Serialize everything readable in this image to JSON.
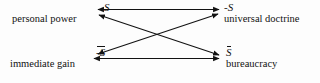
{
  "diagram": {
    "type": "semiotic-square",
    "title": "",
    "background_color": "#fdfdfd",
    "stroke_color": "#121212",
    "nodes": [
      {
        "id": "s",
        "position": "top-left",
        "symbol": "S",
        "symbol_overbar": false,
        "symbol_negated": false,
        "label": "personal power"
      },
      {
        "id": "not-s",
        "position": "top-right",
        "symbol": "-S",
        "symbol_overbar": false,
        "symbol_negated": true,
        "label": "universal doctrine"
      },
      {
        "id": "not-s-bar",
        "position": "bottom-left",
        "symbol": "-S",
        "symbol_overbar": true,
        "symbol_negated": true,
        "label": "immediate gain"
      },
      {
        "id": "s-bar",
        "position": "bottom-right",
        "symbol": "S",
        "symbol_overbar": true,
        "symbol_negated": false,
        "label": "bureaucracy"
      }
    ],
    "edges": [
      {
        "id": "top-edge",
        "from": "s",
        "to": "not-s",
        "arrowheads": "both",
        "orientation": "horizontal"
      },
      {
        "id": "bottom-edge",
        "from": "not-s-bar",
        "to": "s-bar",
        "arrowheads": "both",
        "orientation": "horizontal"
      },
      {
        "id": "diagonal-one",
        "from": "s",
        "to": "s-bar",
        "arrowheads": "both",
        "orientation": "diagonal"
      },
      {
        "id": "diagonal-two",
        "from": "not-s",
        "to": "not-s-bar",
        "arrowheads": "both",
        "orientation": "diagonal"
      }
    ]
  }
}
